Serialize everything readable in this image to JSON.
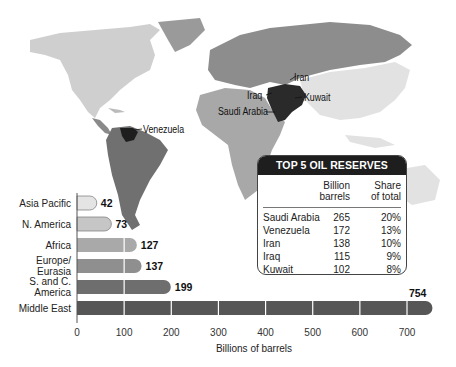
{
  "chart_data": {
    "type": "bar",
    "orientation": "horizontal",
    "title": "",
    "xlabel": "Billions of barrels",
    "ylabel": "",
    "xlim": [
      0,
      754
    ],
    "xticks": [
      0,
      100,
      200,
      300,
      400,
      500,
      600,
      700
    ],
    "categories": [
      "Asia Pacific",
      "N. America",
      "Africa",
      "Europe/ Eurasia",
      "S. and C. America",
      "Middle East"
    ],
    "category_lines": [
      [
        "Asia Pacific"
      ],
      [
        "N. America"
      ],
      [
        "Africa"
      ],
      [
        "Europe/",
        "Eurasia"
      ],
      [
        "S. and C.",
        "America"
      ],
      [
        "Middle East"
      ]
    ],
    "values": [
      42,
      73,
      127,
      137,
      199,
      754
    ],
    "data_labels": [
      "42",
      "73",
      "127",
      "137",
      "199",
      "754"
    ],
    "bar_colors": [
      "#e4e4e4",
      "#c6c6c6",
      "#a9a9a9",
      "#8f8f8f",
      "#6e6e6e",
      "#565656"
    ],
    "grid": false
  },
  "map": {
    "labels": [
      {
        "text": "Iran"
      },
      {
        "text": "Iraq"
      },
      {
        "text": "Kuwait"
      },
      {
        "text": "Saudi Arabia"
      },
      {
        "text": "Venezuela"
      }
    ]
  },
  "table": {
    "title": "TOP 5 OIL RESERVES",
    "col_headers": [
      [
        "Billion",
        "barrels"
      ],
      [
        "Share",
        "of total"
      ]
    ],
    "rows": [
      {
        "country": "Saudi Arabia",
        "barrels": "265",
        "share": "20%"
      },
      {
        "country": "Venezuela",
        "barrels": "172",
        "share": "13%"
      },
      {
        "country": "Iran",
        "barrels": "138",
        "share": "10%"
      },
      {
        "country": "Iraq",
        "barrels": "115",
        "share": "9%"
      },
      {
        "country": "Kuwait",
        "barrels": "102",
        "share": "8%"
      }
    ]
  }
}
